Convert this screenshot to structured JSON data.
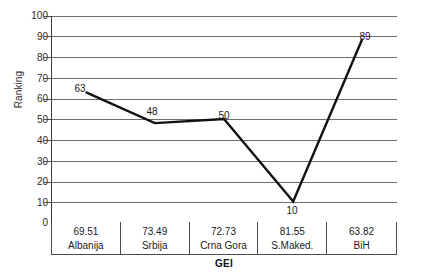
{
  "chart_data": {
    "type": "line",
    "title": "",
    "subtitle": "",
    "xlabel": "GEI",
    "ylabel": "Ranking",
    "categories": [
      "Albanija",
      "Srbija",
      "Crna Gora",
      "S.Maked.",
      "BiH"
    ],
    "category_values": [
      "69.51",
      "73.49",
      "72.73",
      "81.55",
      "63.82"
    ],
    "series": [
      {
        "name": "Ranking",
        "values": [
          63,
          48,
          50,
          10,
          89
        ],
        "point_labels": [
          "63",
          "48",
          "50",
          "10",
          "89"
        ],
        "color": "#111111"
      }
    ],
    "ylim": [
      0,
      100
    ],
    "ytick_step": 10,
    "yticks": [
      "100",
      "90",
      "80",
      "70",
      "60",
      "50",
      "40",
      "30",
      "20",
      "10",
      "0"
    ],
    "grid": true,
    "grid_color": "#6e6e6e",
    "legend": false,
    "legend_position": "none",
    "axis_color": "#3a3a3a",
    "background": "#ffffff"
  },
  "axes": {
    "y_title": "Ranking",
    "x_title": "GEI"
  }
}
